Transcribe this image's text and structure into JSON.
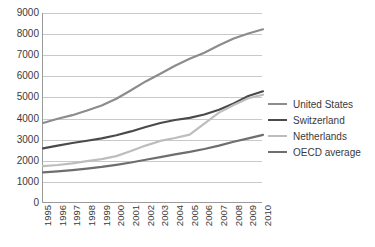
{
  "chart_data": {
    "type": "line",
    "title": "",
    "subtitle": "",
    "xlabel": "",
    "ylabel": "",
    "grid": true,
    "legend_position": "right",
    "xlim": [
      1995,
      2010
    ],
    "ylim": [
      0,
      9000
    ],
    "ytick_step": 1000,
    "categories": [
      "1995",
      "1996",
      "1997",
      "1998",
      "1999",
      "2000",
      "2001",
      "2002",
      "2003",
      "2004",
      "2005",
      "2006",
      "2007",
      "2008",
      "2009",
      "2010"
    ],
    "x": [
      1995,
      1996,
      1997,
      1998,
      1999,
      2000,
      2001,
      2002,
      2003,
      2004,
      2005,
      2006,
      2007,
      2008,
      2009,
      2010
    ],
    "ytick_labels": [
      "9000",
      "8000",
      "7000",
      "6000",
      "5000",
      "4000",
      "3000",
      "2000",
      "1000",
      "0"
    ],
    "ytick_values": [
      9000,
      8000,
      7000,
      6000,
      5000,
      4000,
      3000,
      2000,
      1000,
      0
    ],
    "series": [
      {
        "name": "United States",
        "color": "#8c8c8c",
        "values": [
          3790,
          3990,
          4160,
          4380,
          4620,
          4940,
          5340,
          5760,
          6120,
          6500,
          6830,
          7120,
          7470,
          7790,
          8030,
          8230
        ]
      },
      {
        "name": "Switzerland",
        "color": "#4a4a4a",
        "values": [
          2590,
          2720,
          2840,
          2950,
          3060,
          3210,
          3390,
          3600,
          3790,
          3930,
          4030,
          4190,
          4420,
          4710,
          5070,
          5290
        ]
      },
      {
        "name": "Netherlands",
        "color": "#bdbdbd",
        "values": [
          1750,
          1800,
          1880,
          1980,
          2080,
          2220,
          2460,
          2720,
          2940,
          3080,
          3240,
          3760,
          4280,
          4640,
          4960,
          5130
        ]
      },
      {
        "name": "OECD average",
        "color": "#6e6e6e",
        "values": [
          1450,
          1500,
          1560,
          1630,
          1710,
          1810,
          1920,
          2050,
          2170,
          2300,
          2420,
          2560,
          2720,
          2900,
          3060,
          3230
        ]
      }
    ]
  },
  "legend": {
    "items": [
      {
        "label": "United States"
      },
      {
        "label": "Switzerland"
      },
      {
        "label": "Netherlands"
      },
      {
        "label": "OECD average"
      }
    ]
  }
}
